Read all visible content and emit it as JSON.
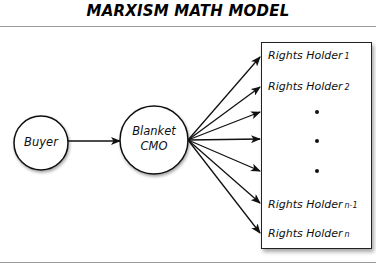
{
  "title": "MARXISM MATH MODEL",
  "nodes": {
    "buyer": {
      "label": "Buyer"
    },
    "cmo": {
      "line1": "Blanket",
      "line2": "CMO"
    }
  },
  "rights_holders": [
    {
      "label": "Rights Holder",
      "sub": "1"
    },
    {
      "label": "Rights Holder",
      "sub": "2"
    },
    {
      "label": "•",
      "sub": ""
    },
    {
      "label": "•",
      "sub": ""
    },
    {
      "label": "•",
      "sub": ""
    },
    {
      "label": "Rights Holder",
      "sub": "n-1"
    },
    {
      "label": "Rights Holder",
      "sub": "n"
    }
  ],
  "edges": [
    {
      "from": "Buyer",
      "to": "Blanket CMO"
    },
    {
      "from": "Blanket CMO",
      "to": "Rights Holder 1"
    },
    {
      "from": "Blanket CMO",
      "to": "Rights Holder 2"
    },
    {
      "from": "Blanket CMO",
      "to": "ellipsis-1"
    },
    {
      "from": "Blanket CMO",
      "to": "ellipsis-2"
    },
    {
      "from": "Blanket CMO",
      "to": "ellipsis-3"
    },
    {
      "from": "Blanket CMO",
      "to": "Rights Holder n-1"
    },
    {
      "from": "Blanket CMO",
      "to": "Rights Holder n"
    }
  ],
  "colors": {
    "stroke": "#111111",
    "rule": "#9a9a9a",
    "background": "#ffffff"
  }
}
